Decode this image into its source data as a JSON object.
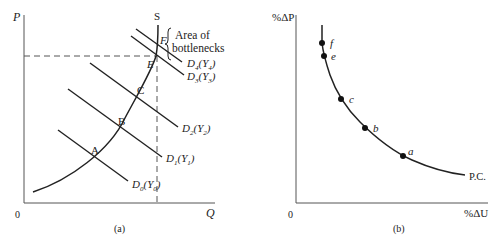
{
  "panel_a": {
    "caption": "(a)",
    "y_axis_label": "P",
    "x_axis_label": "Q",
    "origin_label": "0",
    "supply_label": "S",
    "bottleneck_note_line1": "Area of",
    "bottleneck_note_line2": "bottlenecks",
    "points": [
      {
        "label": "A"
      },
      {
        "label": "B"
      },
      {
        "label": "C"
      },
      {
        "label": "E"
      },
      {
        "label": "F"
      }
    ],
    "demand_curves": [
      {
        "label": "D",
        "sub": "0",
        "income": "Y",
        "income_sub": "0"
      },
      {
        "label": "D",
        "sub": "1",
        "income": "Y",
        "income_sub": "1"
      },
      {
        "label": "D",
        "sub": "2",
        "income": "Y",
        "income_sub": "2"
      },
      {
        "label": "D",
        "sub": "3",
        "income": "Y",
        "income_sub": "3"
      },
      {
        "label": "D",
        "sub": "4",
        "income": "Y",
        "income_sub": "4"
      }
    ]
  },
  "panel_b": {
    "caption": "(b)",
    "y_axis_label": "%ΔP",
    "x_axis_label": "%ΔU",
    "origin_label": "0",
    "curve_label": "P.C.",
    "points": [
      {
        "label": "f"
      },
      {
        "label": "e"
      },
      {
        "label": "c"
      },
      {
        "label": "b"
      },
      {
        "label": "a"
      }
    ]
  },
  "colors": {
    "ink": "#222222",
    "axis": "#555555",
    "background": "#ffffff"
  }
}
